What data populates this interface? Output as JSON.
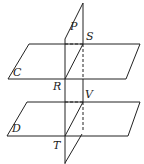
{
  "diagram": {
    "type": "geometry-planes",
    "labels": {
      "P": "P",
      "S": "S",
      "C": "C",
      "R": "R",
      "V": "V",
      "D": "D",
      "T": "T"
    },
    "colors": {
      "stroke": "#222222",
      "background": "#ffffff"
    }
  }
}
